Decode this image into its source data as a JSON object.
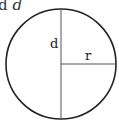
{
  "caption": {
    "prefix": "d",
    "variable": "d"
  },
  "diagram": {
    "labels": {
      "diameter": "d",
      "radius": "r"
    },
    "colors": {
      "stroke": "#222222",
      "line": "#555555"
    }
  }
}
